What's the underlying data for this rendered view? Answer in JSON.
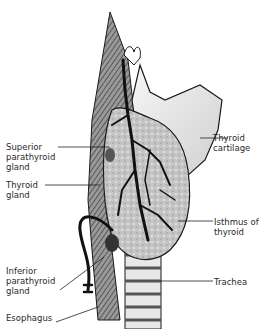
{
  "diagram": {
    "type": "anatomical-illustration",
    "labels": {
      "superior_parathyroid": "Superior\nparathyroid\ngland",
      "thyroid_gland": "Thyroid\ngland",
      "inferior_parathyroid": "Inferior\nparathyroid\ngland",
      "esophagus": "Esophagus",
      "thyroid_cartilage": "Thyroid\ncartilage",
      "isthmus": "Isthmus of\nthyroid",
      "trachea": "Trachea"
    },
    "colors": {
      "ink": "#1a1a1a",
      "gland_fill": "#c9c9c9",
      "cartilage_fill": "#ececec",
      "muscle_fill": "#8a8a8a",
      "text": "#2a2a2a"
    }
  }
}
